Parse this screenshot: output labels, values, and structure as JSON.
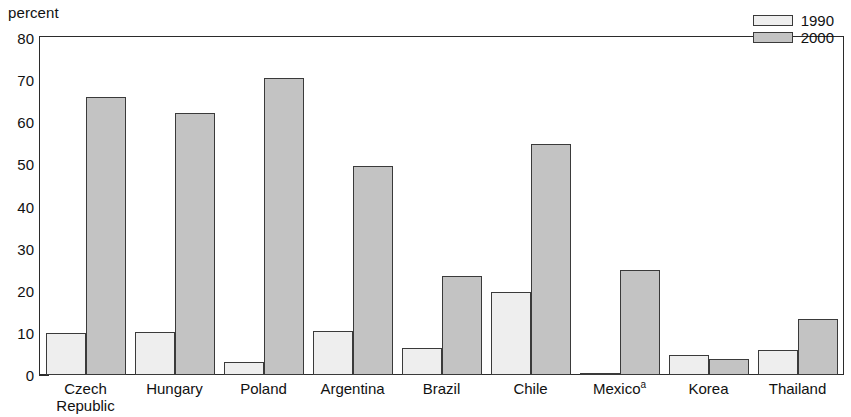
{
  "chart_data": {
    "type": "bar",
    "title": "",
    "xlabel": "",
    "ylabel": "percent",
    "ylim": [
      0,
      80
    ],
    "ytick_step": 10,
    "yminor_step": 5,
    "grid": false,
    "legend_position": "top-right",
    "categories": [
      "Czech Republic",
      "Hungary",
      "Poland",
      "Argentina",
      "Brazil",
      "Chile",
      "Mexico",
      "Korea",
      "Thailand"
    ],
    "category_lines": [
      [
        "Czech",
        "Republic"
      ],
      [
        "Hungary",
        ""
      ],
      [
        "Poland",
        ""
      ],
      [
        "Argentina",
        ""
      ],
      [
        "Brazil",
        ""
      ],
      [
        "Chile",
        ""
      ],
      [
        "Mexico",
        ""
      ],
      [
        "Korea",
        ""
      ],
      [
        "Thailand",
        ""
      ]
    ],
    "category_footnotes": [
      "",
      "",
      "",
      "",
      "",
      "",
      "a",
      "",
      ""
    ],
    "series": [
      {
        "name": "1990",
        "color": "#eeeeee",
        "values": [
          10.0,
          10.1,
          3.0,
          10.4,
          6.3,
          19.7,
          0.3,
          4.7,
          5.9
        ]
      },
      {
        "name": "2000",
        "color": "#c3c3c3",
        "values": [
          66.0,
          62.3,
          70.5,
          49.5,
          23.6,
          54.8,
          24.9,
          3.7,
          13.2
        ]
      }
    ],
    "ytick_labels": [
      "80",
      "70",
      "60",
      "50",
      "40",
      "30",
      "20",
      "10",
      "0"
    ],
    "ytick_values": [
      80,
      70,
      60,
      50,
      40,
      30,
      20,
      10,
      0
    ],
    "yminor_values": [
      75,
      65,
      55,
      45,
      35,
      25,
      15,
      5
    ]
  },
  "legend": {
    "entries": [
      {
        "label": "1990",
        "swatch": "light-gray"
      },
      {
        "label": "2000",
        "swatch": "gray"
      }
    ]
  },
  "axis": {
    "unit_label": "percent"
  }
}
